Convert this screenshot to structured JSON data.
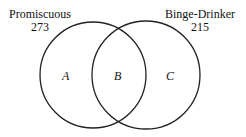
{
  "diagram": {
    "type": "venn",
    "sets": [
      {
        "name": "Promiscuous",
        "count": "273"
      },
      {
        "name": "Binge-Drinker",
        "count": "215"
      }
    ],
    "regions": [
      {
        "label": "A"
      },
      {
        "label": "B"
      },
      {
        "label": "C"
      }
    ]
  }
}
